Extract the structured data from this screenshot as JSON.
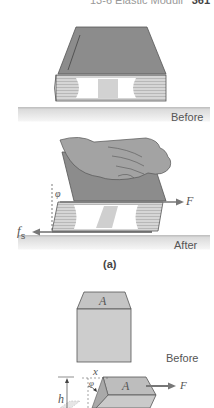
{
  "header": {
    "running_title": "13-6  Elastic Moduli",
    "page_number": "361"
  },
  "figure_a": {
    "panel_before": {
      "caption": "Before"
    },
    "panel_after": {
      "caption": "After",
      "force_label": "F",
      "friction_label": "f",
      "friction_subscript": "s",
      "angle_label": "φ"
    },
    "panel_label": "(a)"
  },
  "figure_b": {
    "panel_before": {
      "caption": "Before",
      "area_label": "A"
    },
    "panel_after": {
      "area_label": "A",
      "force_label": "F",
      "displacement_label": "x",
      "height_label": "h",
      "angle_label": "φ"
    }
  },
  "colors": {
    "book_cover": "#8a8a8a",
    "book_pages": "#c8c8c8",
    "surface_shadow": "#e4e4e4",
    "block_face": "#c9c9c9",
    "arrow": "#7a7a7a"
  }
}
